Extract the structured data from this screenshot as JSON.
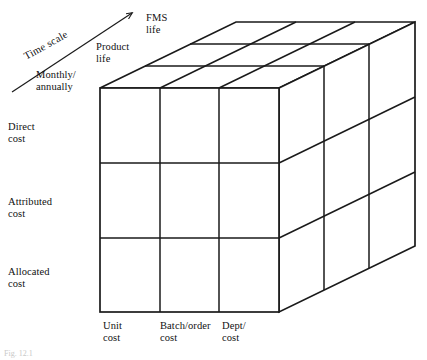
{
  "figure": {
    "type": "3d-cube-matrix-diagram",
    "caption": "Fig. 12.1",
    "background_color": "#ffffff",
    "line_color": "#1a1a1a"
  },
  "axes": {
    "vertical": {
      "name": "cost-attribution-level",
      "labels": [
        {
          "id": "direct-cost",
          "text": "Direct\ncost"
        },
        {
          "id": "attributed-cost",
          "text": "Attributed\ncost"
        },
        {
          "id": "allocated-cost",
          "text": "Allocated\ncost"
        }
      ]
    },
    "horizontal": {
      "name": "cost-object-level",
      "labels": [
        {
          "id": "unit-cost",
          "text": "Unit\ncost"
        },
        {
          "id": "batch-order-cost",
          "text": "Batch/order\ncost"
        },
        {
          "id": "dept-cost",
          "text": "Dept/\ncost"
        }
      ]
    },
    "depth": {
      "name": "time-scale",
      "arrow_label": "Time scale",
      "labels": [
        {
          "id": "monthly-annually",
          "text": "Monthly/\nannually"
        },
        {
          "id": "product-life",
          "text": "Product\nlife"
        },
        {
          "id": "fms-life",
          "text": "FMS\nlife"
        }
      ]
    }
  },
  "geometry": {
    "front_face": {
      "left": 100,
      "top": 88,
      "right": 279,
      "bottom": 312
    },
    "depth_offset": {
      "dx": 136,
      "dy": -66
    },
    "divisions": {
      "columns": 3,
      "rows": 3,
      "layers": 3
    },
    "arrow": {
      "x1": 12,
      "y1": 92,
      "x2": 134,
      "y2": 12
    }
  }
}
